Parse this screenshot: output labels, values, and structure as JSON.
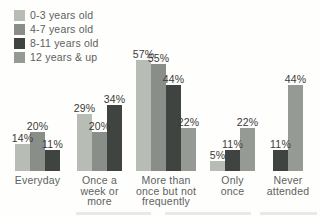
{
  "legend": {
    "items": [
      {
        "label": "0-3 years old",
        "color": "#b7bcb5"
      },
      {
        "label": "4-7 years old",
        "color": "#898e88"
      },
      {
        "label": "8-11 years old",
        "color": "#404440"
      },
      {
        "label": "12 years & up",
        "color": "#969a94"
      }
    ]
  },
  "chart_data": {
    "type": "bar",
    "title": "",
    "xlabel": "",
    "ylabel": "",
    "value_suffix": "%",
    "ylim": [
      0,
      60
    ],
    "grid": false,
    "axes_visible": false,
    "legend_position": "top-left",
    "categories": [
      "Everyday",
      "Once a week or more",
      "More than once but not frequently",
      "Only once",
      "Never attended"
    ],
    "category_display_lines": [
      [
        "Everyday"
      ],
      [
        "Once a",
        "week or",
        "more"
      ],
      [
        "More than",
        "once but not",
        "frequently"
      ],
      [
        "Only",
        "once"
      ],
      [
        "Never",
        "attended"
      ]
    ],
    "series": [
      {
        "name": "0-3 years old",
        "color": "#b7bcb5",
        "values": [
          14,
          29,
          57,
          5,
          null
        ]
      },
      {
        "name": "4-7 years old",
        "color": "#898e88",
        "values": [
          20,
          20,
          55,
          null,
          null
        ]
      },
      {
        "name": "8-11 years old",
        "color": "#404440",
        "values": [
          11,
          34,
          44,
          11,
          11
        ]
      },
      {
        "name": "12 years & up",
        "color": "#969a94",
        "values": [
          null,
          null,
          22,
          22,
          44
        ]
      }
    ]
  }
}
